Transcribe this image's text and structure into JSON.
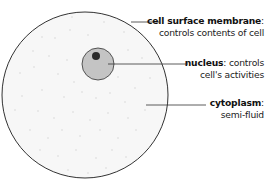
{
  "diagram": {
    "colors": {
      "outline": "#333333",
      "cytoplasm": "#f7f7f7",
      "cytoplasm_dots": "#cfcfcf",
      "nucleus_fill": "#c4c4c4",
      "nucleolus_fill": "#2a2a2a",
      "leader_line": "#333333"
    },
    "labels": [
      {
        "id": "cell-surface-membrane",
        "term": "cell surface membrane",
        "separator": ":",
        "description": "controls contents of cell"
      },
      {
        "id": "nucleus",
        "term": "nucleus",
        "separator": ":",
        "description_line1": "controls",
        "description_line2": "cell's activities"
      },
      {
        "id": "cytoplasm",
        "term": "cytoplasm",
        "separator": ":",
        "description": "semi-fluid"
      }
    ]
  }
}
